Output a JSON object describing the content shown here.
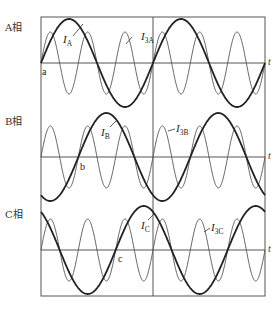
{
  "diagram": {
    "frame": {
      "left": 41,
      "right": 265,
      "top": 17,
      "bottom": 296,
      "divider_x": 153
    },
    "fundamental_period_px": 112,
    "colors": {
      "fundamental": "#222222",
      "harmonic": "#555555",
      "axis": "#555555",
      "background": "#ffffff"
    },
    "axis_symbol": "t",
    "phases": [
      {
        "id": "A",
        "label": "A相",
        "axis_y": 63,
        "fundamental": {
          "name": "I",
          "sub": "A",
          "amplitude": 44,
          "phase_deg": 0,
          "label_x": 63,
          "label_y": 43,
          "leader": [
            73,
            36,
            83,
            24
          ]
        },
        "harmonic": {
          "name": "I",
          "sub": "3A",
          "amplitude": 31,
          "phase_deg": 0,
          "label_x": 141,
          "label_y": 40,
          "leader": [
            132,
            37,
            126,
            44
          ]
        },
        "point": {
          "label": "a",
          "x": 42,
          "y": 75
        }
      },
      {
        "id": "B",
        "label": "B相",
        "axis_y": 157,
        "fundamental": {
          "name": "I",
          "sub": "B",
          "amplitude": 44,
          "phase_deg": -120,
          "label_x": 101,
          "label_y": 136,
          "leader": [
            110,
            127,
            117,
            120
          ]
        },
        "harmonic": {
          "name": "I",
          "sub": "3B",
          "amplitude": 31,
          "phase_deg": 0,
          "label_x": 176,
          "label_y": 132,
          "leader": [
            175,
            129,
            168,
            131
          ]
        },
        "point": {
          "label": "b",
          "x": 80,
          "y": 170
        }
      },
      {
        "id": "C",
        "label": "C相",
        "axis_y": 250,
        "fundamental": {
          "name": "I",
          "sub": "C",
          "amplitude": 44,
          "phase_deg": -240,
          "label_x": 141,
          "label_y": 229,
          "leader": [
            148,
            220,
            154,
            214
          ]
        },
        "harmonic": {
          "name": "I",
          "sub": "3C",
          "amplitude": 31,
          "phase_deg": 0,
          "label_x": 211,
          "label_y": 231,
          "leader": [
            210,
            228,
            204,
            232
          ]
        },
        "point": {
          "label": "c",
          "x": 118,
          "y": 262
        }
      }
    ]
  }
}
